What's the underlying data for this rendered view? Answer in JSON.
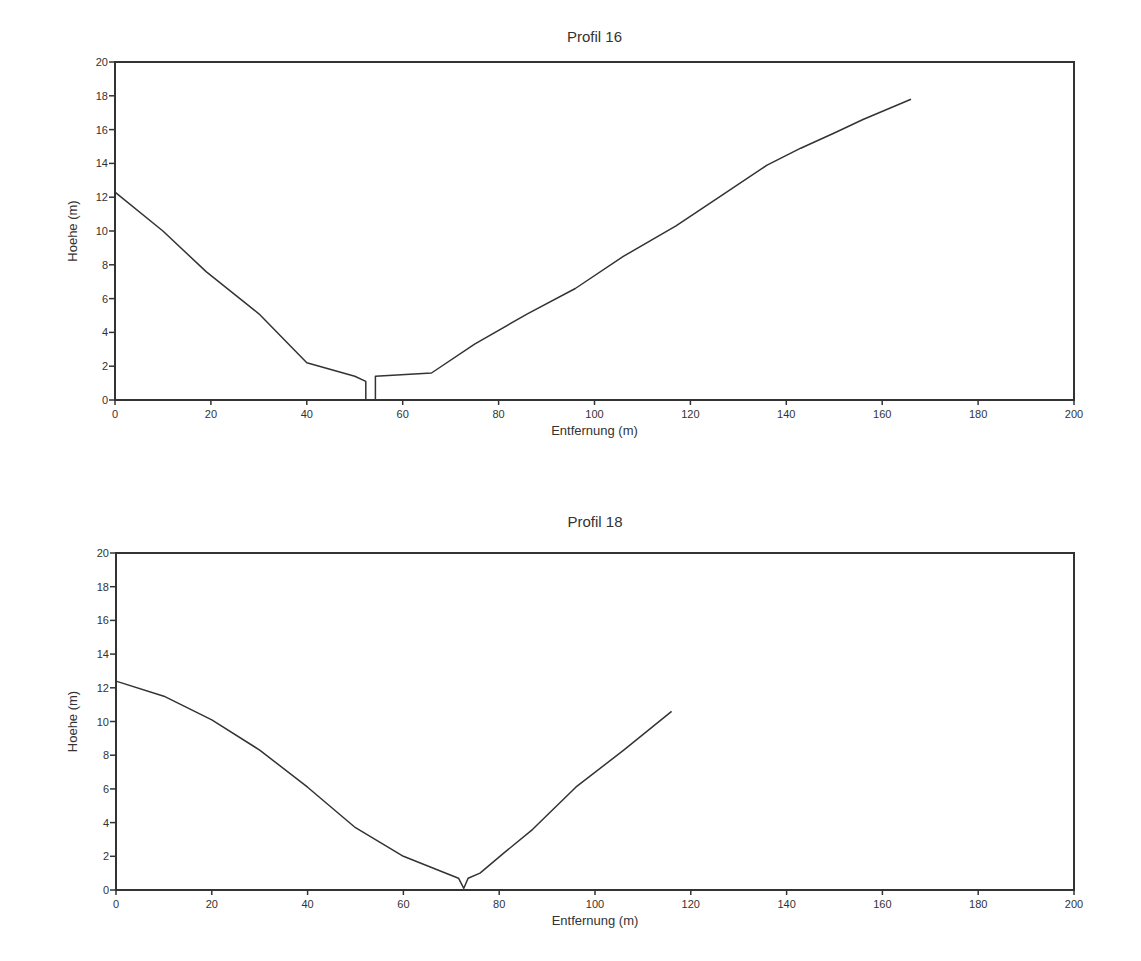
{
  "chart_data": [
    {
      "type": "line",
      "title": "Profil 16",
      "xlabel": "Entfernung (m)",
      "ylabel": "Hoehe (m)",
      "xlim": [
        0,
        200
      ],
      "ylim": [
        0,
        20
      ],
      "xticks": [
        0,
        20,
        40,
        60,
        80,
        100,
        120,
        140,
        160,
        180,
        200
      ],
      "yticks": [
        0,
        2,
        4,
        6,
        8,
        10,
        12,
        14,
        16,
        18,
        20
      ],
      "grid": false,
      "legend": null,
      "series": [
        {
          "name": "Profil 16",
          "x": [
            0,
            10,
            19,
            30,
            40,
            50,
            52.3,
            52.3,
            54.3,
            54.3,
            66,
            75,
            86,
            96,
            106,
            117,
            127,
            136,
            143,
            150,
            156,
            166
          ],
          "y": [
            12.3,
            10.0,
            7.6,
            5.1,
            2.2,
            1.4,
            1.1,
            0,
            0,
            1.4,
            1.6,
            3.3,
            5.1,
            6.6,
            8.5,
            10.3,
            12.2,
            13.9,
            14.9,
            15.8,
            16.6,
            17.8
          ]
        }
      ]
    },
    {
      "type": "line",
      "title": "Profil 18",
      "xlabel": "Entfernung (m)",
      "ylabel": "Hoehe (m)",
      "xlim": [
        0,
        200
      ],
      "ylim": [
        0,
        20
      ],
      "xticks": [
        0,
        20,
        40,
        60,
        80,
        100,
        120,
        140,
        160,
        180,
        200
      ],
      "yticks": [
        0,
        2,
        4,
        6,
        8,
        10,
        12,
        14,
        16,
        18,
        20
      ],
      "grid": false,
      "legend": null,
      "series": [
        {
          "name": "Profil 18",
          "x": [
            0,
            10,
            20,
            30,
            40,
            50,
            60,
            71.5,
            72.6,
            73.5,
            76,
            81,
            87,
            96,
            106,
            116
          ],
          "y": [
            12.4,
            11.5,
            10.1,
            8.3,
            6.1,
            3.7,
            2.0,
            0.7,
            0.1,
            0.7,
            1.0,
            2.2,
            3.6,
            6.1,
            8.3,
            10.6
          ]
        }
      ]
    }
  ]
}
